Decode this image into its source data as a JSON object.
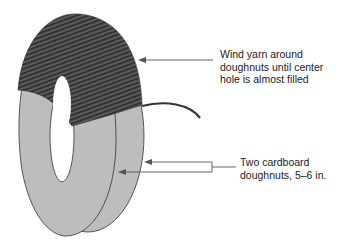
{
  "diagram": {
    "labels": {
      "wind_yarn": [
        "Wind yarn around",
        "doughnuts until center",
        "hole is almost filled"
      ],
      "doughnuts": [
        "Two cardboard",
        "doughnuts, 5–6 in."
      ]
    },
    "colors": {
      "cardboard": "#bdbdbd",
      "yarn": "#4a4a4a",
      "arrow": "#555555"
    }
  }
}
